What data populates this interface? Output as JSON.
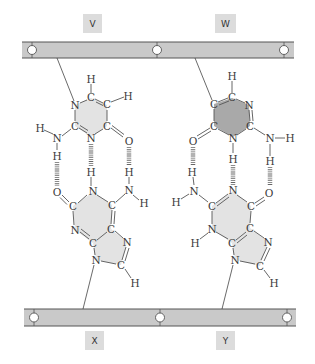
{
  "figure": {
    "type": "DNA base pairing diagram",
    "colors": {
      "background": "#ffffff",
      "backbone_fill": "#c9c9c9",
      "backbone_edge": "#555555",
      "label_box": "#dcdcdc",
      "ring_fill_light": "#e3e3e3",
      "ring_fill_dark": "#a9a9a9",
      "atom_text": "#3a3a3a"
    }
  },
  "labels": {
    "V": "V",
    "W": "W",
    "X": "X",
    "Y": "Y"
  },
  "backbones": {
    "top": {
      "name": "top strand",
      "joints": 3
    },
    "bottom": {
      "name": "bottom strand",
      "joints": 3
    }
  },
  "atoms": {
    "left_top": {
      "H_top": "H",
      "C1": "C",
      "C2": "C",
      "H_right": "H",
      "N1": "N",
      "C3": "C",
      "N3": "N",
      "C4": "C",
      "O": "O",
      "N_amino": "N",
      "H_amino_left": "H",
      "H_amino_down": "H"
    },
    "left_bottom": {
      "H_top": "H",
      "H_amino_top": "H",
      "O": "O",
      "N1": "N",
      "N_amino": "N",
      "H_amino_right": "H",
      "C1": "C",
      "C2": "C",
      "N3": "N",
      "C3": "C",
      "C4": "C",
      "N7": "N",
      "N9": "N",
      "C8": "C",
      "H8": "H"
    },
    "right_top": {
      "H_top": "H",
      "C1": "C",
      "C2": "C",
      "N3": "N",
      "C3": "C",
      "N1": "N",
      "C4": "C",
      "O": "O",
      "H_n": "H",
      "N_amino": "N",
      "H_amino_right": "H",
      "H_amino_down": "H"
    },
    "right_bottom": {
      "H_amino_top": "H",
      "N_amino": "N",
      "H_amino_left": "H",
      "N1": "N",
      "O": "O",
      "C1": "C",
      "C2": "C",
      "N3": "N",
      "H3": "H",
      "C3": "C",
      "C4": "C",
      "N7": "N",
      "N9": "N",
      "C8": "C",
      "H8": "H"
    }
  }
}
